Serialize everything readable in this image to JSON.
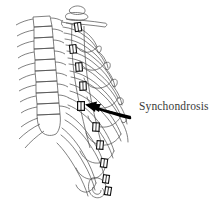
{
  "figure": {
    "type": "anatomical-line-drawing",
    "background_color": "#ffffff",
    "line_color": "#4a4a4a",
    "marker_color": "#1a1a1a",
    "arrow_color": "#000000",
    "text_color": "#3a3a3a"
  },
  "annotation": {
    "label": "Synchondrosis",
    "arrow": {
      "name": "leader-arrow",
      "direction": "points-left-up",
      "tail_x": 129,
      "tail_y": 115,
      "tip_x": 93,
      "tip_y": 106
    }
  },
  "structures": {
    "vertebral_column": {
      "name": "vertebral-column",
      "vertebra_count": 10
    },
    "sternum": {
      "name": "sternum"
    },
    "rib_pairs": {
      "name": "ribs",
      "count": 10
    },
    "synchondroses": {
      "name": "synchondrosis-markers",
      "count": 10,
      "positions": [
        {
          "x": 78,
          "y": 27,
          "angle": -8
        },
        {
          "x": 73,
          "y": 49,
          "angle": -6
        },
        {
          "x": 79,
          "y": 67,
          "angle": -4
        },
        {
          "x": 83,
          "y": 86,
          "angle": -2
        },
        {
          "x": 81,
          "y": 106,
          "angle": 0
        },
        {
          "x": 96,
          "y": 127,
          "angle": 3
        },
        {
          "x": 100,
          "y": 145,
          "angle": 5
        },
        {
          "x": 104,
          "y": 163,
          "angle": 7
        },
        {
          "x": 106,
          "y": 179,
          "angle": 8
        },
        {
          "x": 108,
          "y": 191,
          "angle": 9
        }
      ]
    }
  }
}
